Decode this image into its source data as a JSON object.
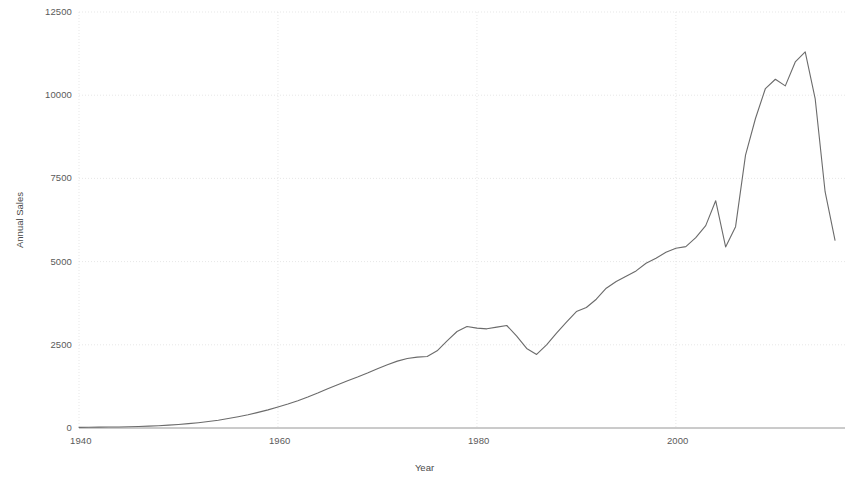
{
  "chart_data": {
    "type": "line",
    "title": "",
    "subtitle": "",
    "xlabel": "Year",
    "ylabel": "Annual Sales",
    "xlim": [
      1940,
      1.0
    ],
    "x_min": 1940,
    "x_max": 2017,
    "ylim": [
      0,
      12500
    ],
    "y_ticks": [
      0,
      2500,
      5000,
      7500,
      10000,
      12500
    ],
    "y_tick_labels": [
      "0",
      "2500",
      "5000",
      "7500",
      "10000",
      "12500"
    ],
    "x_ticks": [
      1940,
      1960,
      1980,
      2000
    ],
    "x_tick_labels": [
      "1940",
      "1960",
      "1980",
      "2000"
    ],
    "grid": true,
    "grid_color": "#dcdcdc",
    "legend": null,
    "line_color": "#6b6b6b",
    "line_width": 1.1,
    "series": [
      {
        "name": "Annual Sales",
        "x": [
          1940,
          1941,
          1942,
          1943,
          1944,
          1945,
          1946,
          1947,
          1948,
          1949,
          1950,
          1951,
          1952,
          1953,
          1954,
          1955,
          1956,
          1957,
          1958,
          1959,
          1960,
          1961,
          1962,
          1963,
          1964,
          1965,
          1966,
          1967,
          1968,
          1969,
          1970,
          1971,
          1972,
          1973,
          1974,
          1975,
          1976,
          1977,
          1978,
          1979,
          1980,
          1981,
          1982,
          1983,
          1984,
          1985,
          1986,
          1987,
          1988,
          1989,
          1990,
          1991,
          1992,
          1993,
          1994,
          1995,
          1996,
          1997,
          1998,
          1999,
          2000,
          2001,
          2002,
          2003,
          2004,
          2005,
          2006,
          2007,
          2008,
          2009,
          2010,
          2011,
          2012,
          2013,
          2014,
          2015,
          2016
        ],
        "values": [
          20,
          22,
          25,
          28,
          32,
          38,
          45,
          55,
          68,
          85,
          105,
          130,
          160,
          195,
          235,
          285,
          340,
          400,
          470,
          545,
          630,
          720,
          820,
          930,
          1050,
          1180,
          1300,
          1420,
          1530,
          1650,
          1780,
          1900,
          2010,
          2090,
          2130,
          2150,
          2320,
          2620,
          2900,
          3050,
          3000,
          2980,
          3030,
          3080,
          2760,
          2390,
          2210,
          2500,
          2850,
          3180,
          3500,
          3620,
          3870,
          4200,
          4400,
          4560,
          4720,
          4950,
          5100,
          5280,
          5400,
          5450,
          5720,
          6080,
          6830,
          5440,
          6050,
          8200,
          9300,
          10200,
          10480,
          10280,
          11000,
          11300,
          9900,
          7100,
          5640
        ]
      }
    ]
  },
  "axes": {
    "y_title": "Annual Sales",
    "x_title": "Year"
  },
  "layout": {
    "plot_left": 79,
    "plot_right": 845,
    "plot_top": 12,
    "plot_bottom": 428
  }
}
